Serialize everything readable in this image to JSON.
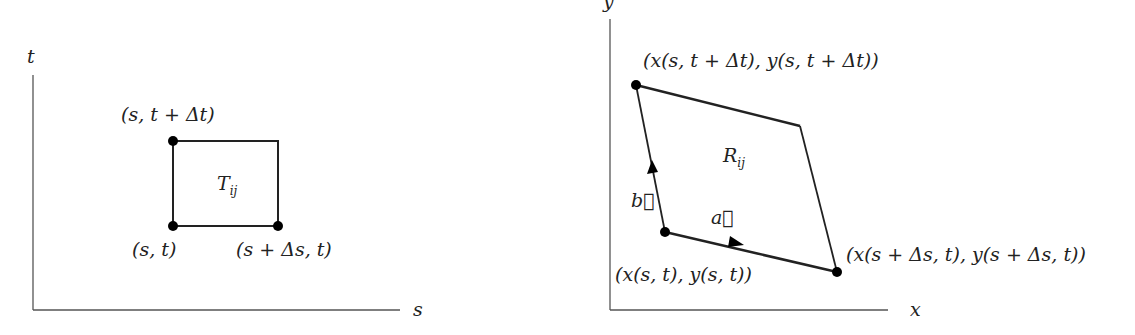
{
  "left_diagram": {
    "axes": {
      "horizontal_label": "s",
      "vertical_label": "t"
    },
    "region_label": {
      "main": "T",
      "sub": "ij"
    },
    "points": [
      {
        "id": "origin",
        "label": "(s, t)"
      },
      {
        "id": "right",
        "label": "(s + Δs, t)"
      },
      {
        "id": "top",
        "label": "(s, t + Δt)"
      }
    ]
  },
  "right_diagram": {
    "axes": {
      "horizontal_label": "x",
      "vertical_label": "y"
    },
    "region_label": {
      "main": "R",
      "sub": "ij"
    },
    "points": [
      {
        "id": "origin",
        "label": "(x(s, t), y(s, t))"
      },
      {
        "id": "right",
        "label": "(x(s + Δs, t), y(s + Δs, t))"
      },
      {
        "id": "top",
        "label": "(x(s, t + Δt), y(s, t + Δt))"
      }
    ],
    "vectors": [
      {
        "id": "a",
        "label": "a⃗"
      },
      {
        "id": "b",
        "label": "b⃗"
      }
    ]
  },
  "colors": {
    "line": "#222222",
    "axis": "#555555",
    "background": "#ffffff"
  }
}
